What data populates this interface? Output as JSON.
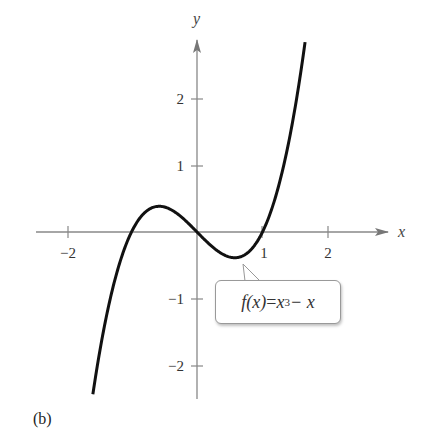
{
  "figure": {
    "panel_label": "(b)",
    "callout": {
      "lhs": "f(x)",
      "equals": " = ",
      "base": "x",
      "exponent": "3",
      "rest": " − x",
      "full_text": "f(x) = x^3 − x"
    }
  },
  "chart_data": {
    "type": "line",
    "title": "",
    "function": "f(x) = x^3 - x",
    "xlabel": "x",
    "ylabel": "y",
    "xlim": [
      -2.5,
      2.7
    ],
    "ylim": [
      -2.5,
      3.1
    ],
    "x_ticks": [
      -2,
      1,
      2
    ],
    "x_tick_labels": [
      "−2",
      "1",
      "2"
    ],
    "y_ticks": [
      2,
      1,
      -1,
      -2
    ],
    "y_tick_labels": [
      "2",
      "1",
      "−1",
      "−2"
    ],
    "grid": false,
    "legend": null,
    "annotations": [
      {
        "text": "f(x) = x^3 − x",
        "points_to": {
          "x": 0.58,
          "y": -0.38
        }
      }
    ],
    "series": [
      {
        "name": "f(x) = x^3 - x",
        "x": [
          -1.59,
          -1.5,
          -1.25,
          -1.0,
          -0.75,
          -0.577,
          -0.5,
          -0.25,
          0,
          0.25,
          0.5,
          0.577,
          0.75,
          1.0,
          1.25,
          1.5,
          1.65
        ],
        "y": [
          -2.43,
          -1.88,
          -0.7,
          0.0,
          0.33,
          0.385,
          0.375,
          0.23,
          0,
          -0.23,
          -0.375,
          -0.385,
          -0.33,
          0.0,
          0.7,
          1.88,
          2.84
        ]
      }
    ],
    "key_points": {
      "roots": [
        -1,
        0,
        1
      ],
      "local_max": {
        "x": -0.577,
        "y": 0.385
      },
      "local_min": {
        "x": 0.577,
        "y": -0.385
      }
    }
  }
}
